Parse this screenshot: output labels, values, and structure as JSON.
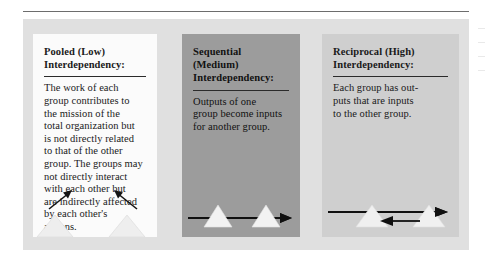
{
  "figure": {
    "background_color": "#e0e0e0",
    "rule_color": "#6d6d6d",
    "panels": [
      {
        "id": "pooled",
        "title": "Pooled (Low)\nInterdependency:",
        "body": "The work of each\ngroup contributes to\nthe mission of the\ntotal organization but\nis not directly related\nto that of the other\ngroup. The groups may\nnot directly interact\nwith each other but\nare indirectly affected\nby each other's\nactions.",
        "background_color": "#fbfbfb",
        "diagram": "two-groups-pointing-inward"
      },
      {
        "id": "sequential",
        "title": "Sequential (Medium)\nInterdependency:",
        "body": "Outputs of one\ngroup become inputs\nfor another group.",
        "background_color": "#9c9c9c",
        "diagram": "one-way-arrow-through-two-groups"
      },
      {
        "id": "reciprocal",
        "title": "Reciprocal (High)\nInterdependency:",
        "body": "Each group has out-\nputs that are inputs\nto the other group.",
        "background_color": "#cfcfcf",
        "diagram": "two-way-arrows-between-two-groups"
      }
    ]
  },
  "margin_marks": {
    "count": 4
  }
}
